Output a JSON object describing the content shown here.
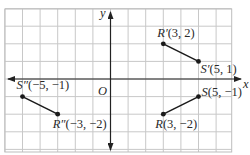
{
  "diagram": {
    "type": "coordinate-plane-reflection",
    "axes": {
      "x_label": "x",
      "y_label": "y",
      "origin_label": "O"
    },
    "grid": {
      "x_min": -6,
      "x_max": 7,
      "y_min": -4,
      "y_max": 4
    },
    "segments": [
      {
        "name": "RS",
        "points": [
          {
            "name": "R",
            "label": "R(3, −2)",
            "x": 3,
            "y": -2
          },
          {
            "name": "S",
            "label": "S(5, −1)",
            "x": 5,
            "y": -1
          }
        ]
      },
      {
        "name": "R'S'",
        "points": [
          {
            "name": "R'",
            "label": "R′(3, 2)",
            "x": 3,
            "y": 2
          },
          {
            "name": "S'",
            "label": "S′(5, 1)",
            "x": 5,
            "y": 1
          }
        ]
      },
      {
        "name": "R''S''",
        "points": [
          {
            "name": "R''",
            "label": "R″(−3, −2)",
            "x": -3,
            "y": -2
          },
          {
            "name": "S''",
            "label": "S″(−5, −1)",
            "x": -5,
            "y": -1
          }
        ]
      }
    ],
    "colors": {
      "grid": "#c8c8c8",
      "grid_border": "#bdbdbd",
      "axis": "#222222",
      "segment": "#1a1a1a",
      "text": "#2a2a2a"
    }
  }
}
